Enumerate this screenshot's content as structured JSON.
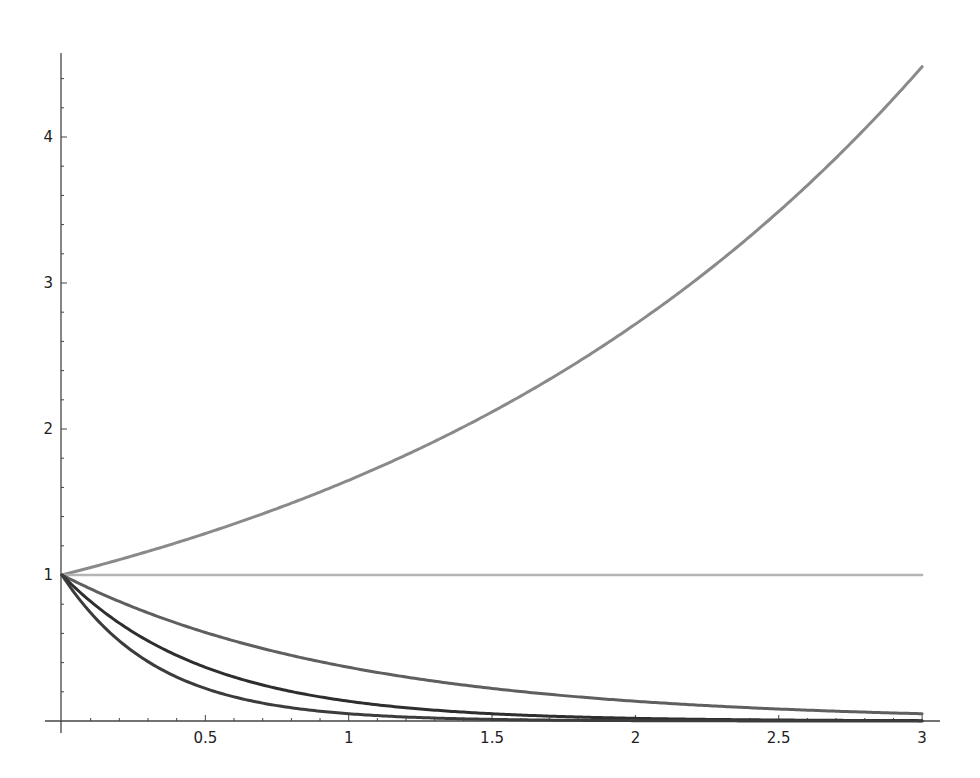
{
  "chart_data": {
    "type": "line",
    "title": "",
    "xlabel": "",
    "ylabel": "",
    "xlim": [
      0,
      3
    ],
    "ylim": [
      0,
      4.5
    ],
    "grid": false,
    "legend": null,
    "x_ticks": [
      {
        "value": 0.5,
        "label": "0.5"
      },
      {
        "value": 1,
        "label": "1"
      },
      {
        "value": 1.5,
        "label": "1.5"
      },
      {
        "value": 2,
        "label": "2"
      },
      {
        "value": 2.5,
        "label": "2.5"
      },
      {
        "value": 3,
        "label": "3"
      }
    ],
    "y_ticks": [
      {
        "value": 1,
        "label": "1"
      },
      {
        "value": 2,
        "label": "2"
      },
      {
        "value": 3,
        "label": "3"
      },
      {
        "value": 4,
        "label": "4"
      }
    ],
    "x": [
      0,
      0.25,
      0.5,
      0.75,
      1,
      1.25,
      1.5,
      1.75,
      2,
      2.25,
      2.5,
      2.75,
      3
    ],
    "series": [
      {
        "name": "exp(x/2)",
        "color": "#8a8a8a",
        "width": 3,
        "values": [
          1.0,
          1.133,
          1.284,
          1.455,
          1.649,
          1.868,
          2.117,
          2.399,
          2.718,
          3.08,
          3.49,
          3.955,
          4.482
        ]
      },
      {
        "name": "1",
        "color": "#b4b4b4",
        "width": 2.5,
        "values": [
          1,
          1,
          1,
          1,
          1,
          1,
          1,
          1,
          1,
          1,
          1,
          1,
          1
        ]
      },
      {
        "name": "exp(-x)",
        "color": "#5f5f5f",
        "width": 3,
        "values": [
          1.0,
          0.779,
          0.607,
          0.472,
          0.368,
          0.287,
          0.223,
          0.174,
          0.135,
          0.105,
          0.082,
          0.064,
          0.05
        ]
      },
      {
        "name": "exp(-2x)",
        "color": "#2e2e2e",
        "width": 3,
        "values": [
          1.0,
          0.607,
          0.368,
          0.223,
          0.135,
          0.082,
          0.05,
          0.03,
          0.018,
          0.011,
          0.007,
          0.004,
          0.002
        ]
      },
      {
        "name": "exp(-3x)",
        "color": "#3c3c3c",
        "width": 3,
        "values": [
          1.0,
          0.472,
          0.223,
          0.105,
          0.05,
          0.024,
          0.011,
          0.005,
          0.002,
          0.001,
          0.001,
          0.0,
          0.0
        ]
      }
    ]
  },
  "layout": {
    "x0_px": 62,
    "x_px_per_unit": 286.7,
    "y0_px": 721,
    "y_px_per_unit": 146,
    "x_axis_start_px": 45,
    "x_axis_end_px": 940,
    "y_axis_x_px": 61,
    "y_axis_top_px": 53,
    "axis_color": "#444444"
  }
}
